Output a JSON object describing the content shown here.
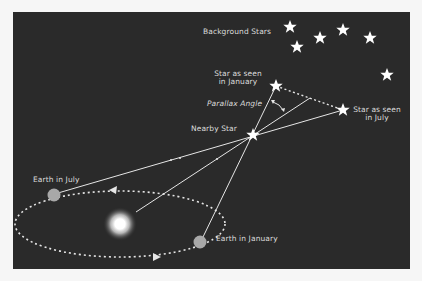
{
  "diagram": {
    "labels": {
      "background_stars": "Background Stars",
      "star_january_line1": "Star as seen",
      "star_january_line2": "in January",
      "star_july_line1": "Star as seen",
      "star_july_line2": "in July",
      "parallax_angle": "Parallax Angle",
      "nearby_star": "Nearby Star",
      "earth_july": "Earth in July",
      "earth_january": "Earth in January"
    },
    "nodes": {
      "sun": {
        "x": 120,
        "y": 224
      },
      "earth_july": {
        "x": 54,
        "y": 195
      },
      "earth_january": {
        "x": 200,
        "y": 242
      },
      "nearby_star": {
        "x": 253,
        "y": 135
      },
      "star_january": {
        "x": 276,
        "y": 86
      },
      "star_july": {
        "x": 343,
        "y": 110
      }
    },
    "background_stars": [
      {
        "x": 290,
        "y": 27
      },
      {
        "x": 297,
        "y": 47
      },
      {
        "x": 320,
        "y": 38
      },
      {
        "x": 343,
        "y": 30
      },
      {
        "x": 370,
        "y": 38
      },
      {
        "x": 387,
        "y": 75
      }
    ],
    "colors": {
      "background": "#2a2a2a",
      "line": "#e6e6e6",
      "earth": "#a8a8a8",
      "text": "#dcdcdc"
    }
  }
}
